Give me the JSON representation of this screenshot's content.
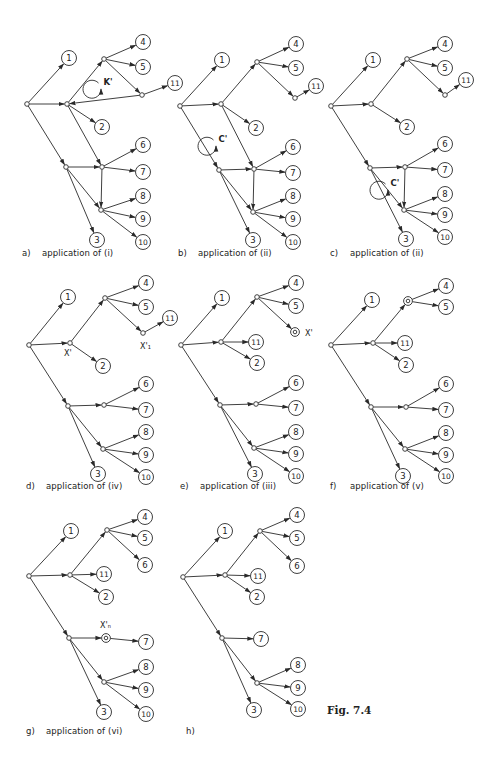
{
  "figure": {
    "label": "Fig. 7.4",
    "stroke_color": "#2a2a2a",
    "background": "#ffffff"
  },
  "panels": [
    {
      "id": "a",
      "tag": "a)",
      "caption": "application of  (i)",
      "caption_pos": [
        22,
        252
      ],
      "offset": [
        0,
        0
      ],
      "nodes": {
        "r": [
          27,
          104,
          "j"
        ],
        "A": [
          67,
          104,
          "j"
        ],
        "U": [
          104,
          59,
          "j"
        ],
        "K": [
          142,
          95,
          "j"
        ],
        "B": [
          66,
          167,
          "j"
        ],
        "M": [
          102,
          167,
          "j"
        ],
        "L": [
          101,
          210,
          "j"
        ],
        "1": [
          69,
          58,
          "c"
        ],
        "2": [
          102,
          127,
          "c"
        ],
        "3": [
          97,
          240,
          "c"
        ],
        "4": [
          143,
          42,
          "c"
        ],
        "5": [
          143,
          67,
          "c"
        ],
        "6": [
          143,
          145,
          "c"
        ],
        "7": [
          143,
          172,
          "c"
        ],
        "8": [
          143,
          196,
          "c"
        ],
        "9": [
          143,
          219,
          "c"
        ],
        "10": [
          143,
          242,
          "c"
        ],
        "11": [
          175,
          83,
          "c"
        ]
      },
      "edges": [
        [
          "r",
          "1"
        ],
        [
          "r",
          "A"
        ],
        [
          "r",
          "B"
        ],
        [
          "A",
          "U"
        ],
        [
          "A",
          "2"
        ],
        [
          "A",
          "M"
        ],
        [
          "U",
          "4"
        ],
        [
          "U",
          "5"
        ],
        [
          "U",
          "K"
        ],
        [
          "K",
          "11"
        ],
        [
          "K",
          "A"
        ],
        [
          "B",
          "M"
        ],
        [
          "B",
          "L"
        ],
        [
          "B",
          "3"
        ],
        [
          "M",
          "6"
        ],
        [
          "M",
          "7"
        ],
        [
          "M",
          "L"
        ],
        [
          "L",
          "8"
        ],
        [
          "L",
          "9"
        ],
        [
          "L",
          "10"
        ]
      ],
      "annotations": [
        {
          "type": "cycle",
          "label": "K'",
          "x": 107,
          "y": 82
        }
      ]
    },
    {
      "id": "b",
      "tag": "b)",
      "caption": "application of  (ii)",
      "caption_pos": [
        178,
        252
      ],
      "offset": [
        0,
        0
      ],
      "nodes": {
        "r": [
          180,
          106,
          "j"
        ],
        "A": [
          221,
          104,
          "j"
        ],
        "U": [
          257,
          62,
          "j"
        ],
        "K": [
          295,
          98,
          "j"
        ],
        "B": [
          219,
          170,
          "j"
        ],
        "M": [
          254,
          169,
          "j"
        ],
        "L": [
          253,
          212,
          "j"
        ],
        "1": [
          222,
          60,
          "c"
        ],
        "2": [
          256,
          128,
          "c"
        ],
        "3": [
          253,
          240,
          "c"
        ],
        "4": [
          296,
          44,
          "c"
        ],
        "5": [
          296,
          68,
          "c"
        ],
        "6": [
          293,
          147,
          "c"
        ],
        "7": [
          293,
          173,
          "c"
        ],
        "8": [
          293,
          196,
          "c"
        ],
        "9": [
          293,
          219,
          "c"
        ],
        "10": [
          293,
          242,
          "c"
        ],
        "11": [
          316,
          86,
          "c"
        ]
      },
      "edges": [
        [
          "r",
          "1"
        ],
        [
          "r",
          "A"
        ],
        [
          "r",
          "B"
        ],
        [
          "A",
          "U"
        ],
        [
          "A",
          "2"
        ],
        [
          "A",
          "M"
        ],
        [
          "U",
          "4"
        ],
        [
          "U",
          "5"
        ],
        [
          "U",
          "K"
        ],
        [
          "K",
          "11"
        ],
        [
          "B",
          "M"
        ],
        [
          "B",
          "L"
        ],
        [
          "B",
          "3"
        ],
        [
          "M",
          "6"
        ],
        [
          "M",
          "7"
        ],
        [
          "M",
          "L"
        ],
        [
          "L",
          "8"
        ],
        [
          "L",
          "9"
        ],
        [
          "L",
          "10"
        ]
      ],
      "annotations": [
        {
          "type": "cycle",
          "label": "C'",
          "x": 222,
          "y": 139
        }
      ]
    },
    {
      "id": "c",
      "tag": "c)",
      "caption": "application of  (ii)",
      "caption_pos": [
        330,
        252
      ],
      "offset": [
        0,
        0
      ],
      "nodes": {
        "r": [
          331,
          106,
          "j"
        ],
        "A": [
          371,
          104,
          "j"
        ],
        "U": [
          407,
          59,
          "j"
        ],
        "K": [
          445,
          95,
          "j"
        ],
        "B": [
          370,
          168,
          "j"
        ],
        "M": [
          405,
          167,
          "j"
        ],
        "L": [
          404,
          210,
          "j"
        ],
        "1": [
          373,
          60,
          "c"
        ],
        "2": [
          407,
          127,
          "c"
        ],
        "3": [
          406,
          239,
          "c"
        ],
        "4": [
          445,
          44,
          "c"
        ],
        "5": [
          445,
          68,
          "c"
        ],
        "6": [
          445,
          144,
          "c"
        ],
        "7": [
          445,
          170,
          "c"
        ],
        "8": [
          445,
          194,
          "c"
        ],
        "9": [
          445,
          215,
          "c"
        ],
        "10": [
          445,
          237,
          "c"
        ],
        "11": [
          466,
          80,
          "c"
        ]
      },
      "edges": [
        [
          "r",
          "1"
        ],
        [
          "r",
          "A"
        ],
        [
          "r",
          "B"
        ],
        [
          "A",
          "U"
        ],
        [
          "A",
          "2"
        ],
        [
          "U",
          "4"
        ],
        [
          "U",
          "5"
        ],
        [
          "U",
          "K"
        ],
        [
          "K",
          "11"
        ],
        [
          "B",
          "M"
        ],
        [
          "B",
          "L"
        ],
        [
          "B",
          "3"
        ],
        [
          "M",
          "6"
        ],
        [
          "M",
          "7"
        ],
        [
          "M",
          "L"
        ],
        [
          "L",
          "8"
        ],
        [
          "L",
          "9"
        ],
        [
          "L",
          "10"
        ]
      ],
      "annotations": [
        {
          "type": "cycle",
          "label": "C'",
          "x": 394,
          "y": 183
        }
      ]
    },
    {
      "id": "d",
      "tag": "d)",
      "caption": "application of  (iv)",
      "caption_pos": [
        26,
        485
      ],
      "offset": [
        0,
        0
      ],
      "nodes": {
        "r": [
          29,
          345,
          "j"
        ],
        "A": [
          70,
          343,
          "j"
        ],
        "U": [
          105,
          298,
          "j"
        ],
        "K": [
          143,
          333,
          "j"
        ],
        "B": [
          68,
          406,
          "j"
        ],
        "M": [
          104,
          405,
          "j"
        ],
        "L": [
          103,
          449,
          "j"
        ],
        "1": [
          68,
          297,
          "c"
        ],
        "2": [
          103,
          366,
          "c"
        ],
        "3": [
          98,
          474,
          "c"
        ],
        "4": [
          146,
          283,
          "c"
        ],
        "5": [
          146,
          307,
          "c"
        ],
        "6": [
          146,
          384,
          "c"
        ],
        "7": [
          146,
          410,
          "c"
        ],
        "8": [
          146,
          432,
          "c"
        ],
        "9": [
          146,
          455,
          "c"
        ],
        "10": [
          146,
          477,
          "c"
        ],
        "11": [
          170,
          318,
          "c"
        ]
      },
      "edges": [
        [
          "r",
          "1"
        ],
        [
          "r",
          "A"
        ],
        [
          "r",
          "B"
        ],
        [
          "A",
          "U"
        ],
        [
          "A",
          "2"
        ],
        [
          "U",
          "4"
        ],
        [
          "U",
          "5"
        ],
        [
          "U",
          "K"
        ],
        [
          "K",
          "11"
        ],
        [
          "B",
          "M"
        ],
        [
          "B",
          "L"
        ],
        [
          "B",
          "3"
        ],
        [
          "M",
          "6"
        ],
        [
          "M",
          "7"
        ],
        [
          "L",
          "8"
        ],
        [
          "L",
          "9"
        ],
        [
          "L",
          "10"
        ]
      ],
      "annotations": [
        {
          "type": "label",
          "text": "X'",
          "x": 64,
          "y": 356
        },
        {
          "type": "label",
          "text": "X'₁",
          "x": 140,
          "y": 349
        }
      ]
    },
    {
      "id": "e",
      "tag": "e)",
      "caption": "application of  (iii)",
      "caption_pos": [
        180,
        485
      ],
      "offset": [
        0,
        0
      ],
      "nodes": {
        "r": [
          181,
          345,
          "j"
        ],
        "A": [
          221,
          342,
          "j"
        ],
        "U": [
          257,
          297,
          "j"
        ],
        "X": [
          295,
          332,
          "t"
        ],
        "B": [
          220,
          405,
          "j"
        ],
        "M": [
          256,
          404,
          "j"
        ],
        "L": [
          254,
          448,
          "j"
        ],
        "1": [
          222,
          298,
          "c"
        ],
        "2": [
          257,
          363,
          "c"
        ],
        "3": [
          255,
          474,
          "c"
        ],
        "4": [
          296,
          283,
          "c"
        ],
        "5": [
          296,
          306,
          "c"
        ],
        "6": [
          296,
          383,
          "c"
        ],
        "7": [
          296,
          408,
          "c"
        ],
        "8": [
          296,
          432,
          "c"
        ],
        "9": [
          296,
          454,
          "c"
        ],
        "10": [
          296,
          476,
          "c"
        ],
        "11": [
          256,
          342,
          "c"
        ]
      },
      "edges": [
        [
          "r",
          "1"
        ],
        [
          "r",
          "A"
        ],
        [
          "r",
          "B"
        ],
        [
          "A",
          "U"
        ],
        [
          "A",
          "11"
        ],
        [
          "A",
          "2"
        ],
        [
          "U",
          "4"
        ],
        [
          "U",
          "5"
        ],
        [
          "U",
          "X"
        ],
        [
          "B",
          "M"
        ],
        [
          "B",
          "L"
        ],
        [
          "B",
          "3"
        ],
        [
          "M",
          "6"
        ],
        [
          "M",
          "7"
        ],
        [
          "L",
          "8"
        ],
        [
          "L",
          "9"
        ],
        [
          "L",
          "10"
        ]
      ],
      "annotations": [
        {
          "type": "label",
          "text": "X'",
          "x": 305,
          "y": 336
        }
      ]
    },
    {
      "id": "f",
      "tag": "f)",
      "caption": "application of  (v)",
      "caption_pos": [
        330,
        485
      ],
      "offset": [
        0,
        0
      ],
      "nodes": {
        "r": [
          331,
          345,
          "j"
        ],
        "A": [
          373,
          343,
          "j"
        ],
        "U": [
          408,
          301,
          "t"
        ],
        "B": [
          371,
          407,
          "j"
        ],
        "M": [
          406,
          407,
          "j"
        ],
        "L": [
          405,
          449,
          "j"
        ],
        "1": [
          372,
          300,
          "c"
        ],
        "2": [
          406,
          365,
          "c"
        ],
        "3": [
          403,
          476,
          "c"
        ],
        "4": [
          446,
          286,
          "c"
        ],
        "5": [
          446,
          307,
          "c"
        ],
        "6": [
          446,
          384,
          "c"
        ],
        "7": [
          446,
          410,
          "c"
        ],
        "8": [
          446,
          433,
          "c"
        ],
        "9": [
          446,
          455,
          "c"
        ],
        "10": [
          446,
          476,
          "c"
        ],
        "11": [
          405,
          343,
          "c"
        ]
      },
      "edges": [
        [
          "r",
          "1"
        ],
        [
          "r",
          "A"
        ],
        [
          "r",
          "B"
        ],
        [
          "A",
          "U"
        ],
        [
          "A",
          "11"
        ],
        [
          "A",
          "2"
        ],
        [
          "U",
          "4"
        ],
        [
          "U",
          "5"
        ],
        [
          "B",
          "M"
        ],
        [
          "B",
          "L"
        ],
        [
          "B",
          "3"
        ],
        [
          "M",
          "6"
        ],
        [
          "M",
          "7"
        ],
        [
          "L",
          "8"
        ],
        [
          "L",
          "9"
        ],
        [
          "L",
          "10"
        ]
      ],
      "annotations": []
    },
    {
      "id": "g",
      "tag": "g)",
      "caption": "application of  (vi)",
      "caption_pos": [
        26,
        730
      ],
      "offset": [
        0,
        0
      ],
      "nodes": {
        "r": [
          29,
          576,
          "j"
        ],
        "A": [
          70,
          575,
          "j"
        ],
        "U": [
          107,
          530,
          "j"
        ],
        "B": [
          69,
          638,
          "j"
        ],
        "X": [
          106,
          638,
          "t"
        ],
        "L": [
          104,
          682,
          "j"
        ],
        "1": [
          71,
          531,
          "c"
        ],
        "2": [
          106,
          597,
          "c"
        ],
        "3": [
          104,
          712,
          "c"
        ],
        "4": [
          145,
          517,
          "c"
        ],
        "5": [
          145,
          538,
          "c"
        ],
        "6": [
          145,
          565,
          "c"
        ],
        "7": [
          146,
          642,
          "c"
        ],
        "8": [
          146,
          667,
          "c"
        ],
        "9": [
          146,
          690,
          "c"
        ],
        "10": [
          146,
          714,
          "c"
        ],
        "11": [
          104,
          574,
          "c"
        ]
      },
      "edges": [
        [
          "r",
          "1"
        ],
        [
          "r",
          "A"
        ],
        [
          "r",
          "B"
        ],
        [
          "A",
          "U"
        ],
        [
          "A",
          "11"
        ],
        [
          "A",
          "2"
        ],
        [
          "U",
          "4"
        ],
        [
          "U",
          "5"
        ],
        [
          "U",
          "6"
        ],
        [
          "B",
          "X"
        ],
        [
          "X",
          "7"
        ],
        [
          "B",
          "L"
        ],
        [
          "B",
          "3"
        ],
        [
          "L",
          "8"
        ],
        [
          "L",
          "9"
        ],
        [
          "L",
          "10"
        ]
      ],
      "annotations": [
        {
          "type": "label",
          "text": "X'ₙ",
          "x": 100,
          "y": 628
        }
      ]
    },
    {
      "id": "h",
      "tag": "h)",
      "caption": "",
      "caption_pos": [
        186,
        730
      ],
      "offset": [
        0,
        0
      ],
      "nodes": {
        "r": [
          183,
          577,
          "j"
        ],
        "A": [
          225,
          575,
          "j"
        ],
        "U": [
          260,
          531,
          "j"
        ],
        "B": [
          222,
          638,
          "j"
        ],
        "L": [
          257,
          683,
          "j"
        ],
        "1": [
          225,
          531,
          "c"
        ],
        "2": [
          257,
          597,
          "c"
        ],
        "3": [
          254,
          710,
          "c"
        ],
        "4": [
          297,
          515,
          "c"
        ],
        "5": [
          297,
          538,
          "c"
        ],
        "6": [
          297,
          566,
          "c"
        ],
        "7": [
          261,
          639,
          "c"
        ],
        "8": [
          298,
          665,
          "c"
        ],
        "9": [
          298,
          688,
          "c"
        ],
        "10": [
          298,
          709,
          "c"
        ],
        "11": [
          258,
          576,
          "c"
        ]
      },
      "edges": [
        [
          "r",
          "1"
        ],
        [
          "r",
          "A"
        ],
        [
          "r",
          "B"
        ],
        [
          "A",
          "U"
        ],
        [
          "A",
          "11"
        ],
        [
          "A",
          "2"
        ],
        [
          "U",
          "4"
        ],
        [
          "U",
          "5"
        ],
        [
          "U",
          "6"
        ],
        [
          "B",
          "7"
        ],
        [
          "B",
          "L"
        ],
        [
          "B",
          "3"
        ],
        [
          "L",
          "8"
        ],
        [
          "L",
          "9"
        ],
        [
          "L",
          "10"
        ]
      ],
      "annotations": []
    }
  ]
}
